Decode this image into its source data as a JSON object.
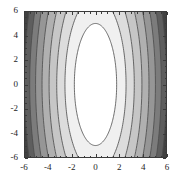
{
  "figure": {
    "width": 174,
    "height": 181,
    "background": "#ffffff",
    "frame_color": "#3a3a3a"
  },
  "chart_data": {
    "type": "heatmap",
    "subtype": "filled-contour-plot",
    "title": "",
    "subtitle": "",
    "xlabel": "",
    "ylabel": "",
    "xlim": [
      -6,
      6
    ],
    "ylim": [
      -6,
      6
    ],
    "grid": false,
    "legend": null,
    "colormap": "grayscale",
    "colormap_direction": "light-center-to-dark-edges",
    "xticks": [
      -6,
      -4,
      -2,
      0,
      2,
      4,
      6
    ],
    "xtick_labels": [
      "-6",
      "-4",
      "-2",
      "0",
      "2",
      "4",
      "6"
    ],
    "yticks": [
      -6,
      -4,
      -2,
      0,
      2,
      4,
      6
    ],
    "ytick_labels": [
      "-6",
      "-4",
      "-2",
      "0",
      "2",
      "4",
      "6"
    ],
    "minor_tick_count_per_interval": 3,
    "contour_levels": [
      1,
      2,
      3,
      4,
      5,
      6,
      7,
      8,
      9
    ],
    "level_fill_colors": [
      "#ffffff",
      "#f0f0f0",
      "#dcdcdc",
      "#c6c6c6",
      "#b0b0b0",
      "#969696",
      "#7c7c7c",
      "#5e5e5e",
      "#414141",
      "#252525"
    ],
    "contour_line_color": "#4a4a4a",
    "contour_line_width": 0.8,
    "innermost_white_region": {
      "shape": "ellipse",
      "center_x": 0,
      "center_y": 0,
      "semi_axis_x": 1.8,
      "semi_axis_y": 5.05
    },
    "contour_semi_axes_x": [
      1.8,
      2.6,
      3.3,
      3.95,
      4.55,
      5.1,
      5.6,
      6.05,
      6.45
    ],
    "contour_semi_axes_y": [
      5.05,
      7.3,
      9.3,
      11.1,
      12.8,
      14.3,
      15.7,
      17.0,
      18.1
    ],
    "symmetry": "mirror-symmetric about both x=0 and y=0"
  },
  "axes": {
    "x_labels": [
      "-6",
      "-4",
      "-2",
      "0",
      "2",
      "4",
      "6"
    ],
    "y_labels": [
      "6",
      "4",
      "2",
      "0",
      "-2",
      "-4",
      "-6"
    ]
  }
}
